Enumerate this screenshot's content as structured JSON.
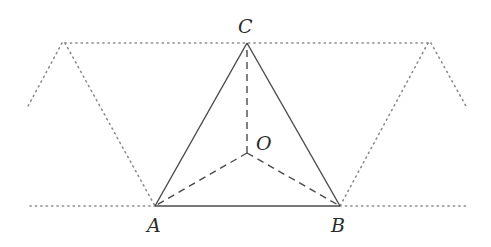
{
  "figure": {
    "colors": {
      "background": "#ffffff",
      "solid_stroke": "#4a4a4a",
      "dotted_stroke": "#8a8a8a",
      "label": "#2b2b2b"
    },
    "points": {
      "A": {
        "label": "A",
        "x": 155,
        "y": 206,
        "label_x": 147,
        "label_y": 232
      },
      "B": {
        "label": "B",
        "x": 340,
        "y": 206,
        "label_x": 331,
        "label_y": 232
      },
      "C": {
        "label": "C",
        "x": 247,
        "y": 43,
        "label_x": 238,
        "label_y": 33
      },
      "O": {
        "label": "O",
        "x": 247,
        "y": 153,
        "label_x": 256,
        "label_y": 150
      }
    },
    "solid_segments": [
      {
        "from": "A",
        "to": "B"
      },
      {
        "from": "B",
        "to": "C"
      },
      {
        "from": "C",
        "to": "A"
      }
    ],
    "dashed_segments": [
      {
        "from": "O",
        "to": "A"
      },
      {
        "from": "O",
        "to": "B"
      },
      {
        "from": "O",
        "to": "C"
      }
    ],
    "dotted_paths": [
      {
        "name": "top-line",
        "points": [
          [
            65,
            43
          ],
          [
            428,
            43
          ]
        ]
      },
      {
        "name": "left-inner-slant",
        "points": [
          [
            65,
            43
          ],
          [
            155,
            206
          ]
        ]
      },
      {
        "name": "left-outer-slant",
        "points": [
          [
            62,
            43
          ],
          [
            27,
            108
          ]
        ]
      },
      {
        "name": "right-inner-slant",
        "points": [
          [
            428,
            43
          ],
          [
            340,
            206
          ]
        ]
      },
      {
        "name": "right-outer-slant",
        "points": [
          [
            431,
            43
          ],
          [
            467,
            108
          ]
        ]
      },
      {
        "name": "bottom-left-line",
        "points": [
          [
            30,
            206
          ],
          [
            155,
            206
          ]
        ]
      },
      {
        "name": "bottom-right-line",
        "points": [
          [
            340,
            206
          ],
          [
            466,
            206
          ]
        ]
      }
    ]
  }
}
